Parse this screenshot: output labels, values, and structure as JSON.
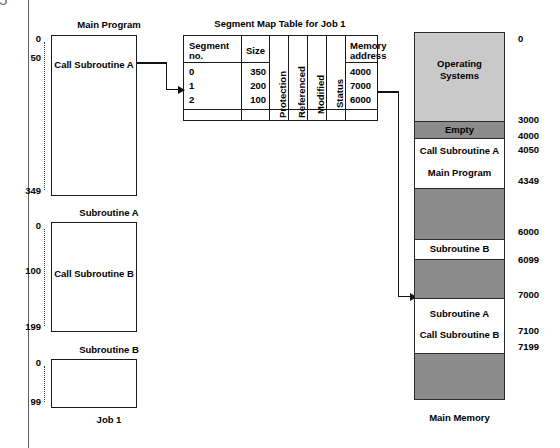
{
  "page": {
    "page_number": "5"
  },
  "figure": {
    "job_label": "Job 1",
    "memory_label": "Main Memory",
    "table_title": "Segment Map Table for Job 1"
  },
  "programs": [
    {
      "title": "Main Program",
      "body_text": "Call Subroutine A",
      "start_label": "0",
      "mark_label": "50",
      "end_label": "349"
    },
    {
      "title": "Subroutine A",
      "body_text": "Call Subroutine B",
      "start_label": "0",
      "mark_label": "100",
      "end_label": "199"
    },
    {
      "title": "Subroutine B",
      "body_text": "",
      "start_label": "0",
      "mark_label": "",
      "end_label": "99"
    }
  ],
  "segment_map_table": {
    "headers": {
      "segment_no": "Segment no.",
      "segment_no_line1": "Segment",
      "segment_no_line2": "no.",
      "size": "Size",
      "protection": "Protection",
      "referenced": "Referenced",
      "modified": "Modified",
      "status": "Status",
      "memory_address_line1": "Memory",
      "memory_address_line2": "address"
    },
    "rows": [
      {
        "segment_no": "0",
        "size": "350",
        "memory_address": "4000"
      },
      {
        "segment_no": "1",
        "size": "200",
        "memory_address": "7000"
      },
      {
        "segment_no": "2",
        "size": "100",
        "memory_address": "6000"
      }
    ]
  },
  "main_memory": {
    "blocks": [
      {
        "label": "Operating Systems",
        "line1": "Operating",
        "line2": "Systems",
        "fill": "#c9c9c9",
        "kind": "os"
      },
      {
        "label": "Empty",
        "line1": "Empty",
        "line2": "",
        "fill": "#8c8c8c",
        "kind": "empty"
      },
      {
        "label": "Call Subroutine A / Main Program",
        "line1": "Call Subroutine A",
        "line2": "Main Program",
        "fill": "#ffffff",
        "kind": "program"
      },
      {
        "label": "",
        "line1": "",
        "line2": "",
        "fill": "#8c8c8c",
        "kind": "free"
      },
      {
        "label": "Subroutine B",
        "line1": "Subroutine B",
        "line2": "",
        "fill": "#ffffff",
        "kind": "program"
      },
      {
        "label": "",
        "line1": "",
        "line2": "",
        "fill": "#8c8c8c",
        "kind": "free"
      },
      {
        "label": "Subroutine A / Call Subroutine B",
        "line1": "Subroutine A",
        "line2": "Call Subroutine B",
        "fill": "#ffffff",
        "kind": "program"
      },
      {
        "label": "",
        "line1": "",
        "line2": "",
        "fill": "#8c8c8c",
        "kind": "free"
      }
    ],
    "addresses": [
      "0",
      "3000",
      "4000",
      "4050",
      "4349",
      "6000",
      "6099",
      "7000",
      "7100",
      "7199"
    ]
  },
  "colors": {
    "os_fill": "#c9c9c9",
    "free_fill": "#8c8c8c",
    "program_fill": "#ffffff",
    "stroke": "#1a1a1a"
  }
}
